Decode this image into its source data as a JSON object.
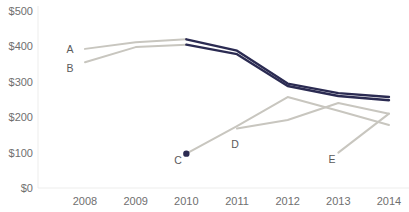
{
  "chart_data": {
    "type": "line",
    "title": "",
    "title_note": "title cropped off top edge of screenshot, illegible",
    "xlabel": "",
    "ylabel": "",
    "x": [
      2008,
      2009,
      2010,
      2011,
      2012,
      2013,
      2014
    ],
    "xtick_labels": [
      "2008",
      "2009",
      "2010",
      "2011",
      "2012",
      "2013",
      "2014"
    ],
    "ytick_labels": [
      "$0",
      "$100",
      "$200",
      "$300",
      "$400",
      "$500"
    ],
    "ytick_values": [
      0,
      100,
      200,
      300,
      400,
      500
    ],
    "ylim": [
      0,
      500
    ],
    "xlim": [
      2008,
      2014
    ],
    "grid": false,
    "legend": "inline-series-labels",
    "series": [
      {
        "name": "A",
        "label": "A",
        "color": "#2b2b52",
        "early_color": "#c8c6bf",
        "x": [
          2008,
          2009,
          2010,
          2011,
          2012,
          2013,
          2014
        ],
        "values": [
          393,
          412,
          420,
          388,
          295,
          268,
          257
        ]
      },
      {
        "name": "B",
        "label": "B",
        "color": "#2b2b52",
        "early_color": "#c8c6bf",
        "x": [
          2008,
          2009,
          2010,
          2011,
          2012,
          2013,
          2014
        ],
        "values": [
          355,
          398,
          405,
          378,
          288,
          260,
          248
        ]
      },
      {
        "name": "C",
        "label": "C",
        "color": "#c8c6bf",
        "marker_color": "#2b2b52",
        "x": [
          2010,
          2011,
          2012,
          2013,
          2014
        ],
        "values": [
          97,
          175,
          257,
          218,
          178
        ]
      },
      {
        "name": "D",
        "label": "D",
        "color": "#c8c6bf",
        "x": [
          2011,
          2012,
          2013,
          2014
        ],
        "values": [
          168,
          192,
          240,
          210
        ]
      },
      {
        "name": "E",
        "label": "E",
        "color": "#c8c6bf",
        "x": [
          2013,
          2014
        ],
        "values": [
          100,
          210
        ]
      }
    ],
    "series_label_points": [
      {
        "label": "A",
        "x": 70,
        "y": 53
      },
      {
        "label": "B",
        "x": 70,
        "y": 72
      },
      {
        "label": "C",
        "x": 178,
        "y": 164
      },
      {
        "label": "D",
        "x": 235,
        "y": 148
      },
      {
        "label": "E",
        "x": 332,
        "y": 163
      }
    ],
    "colors": {
      "navy": "#2b2b52",
      "gray": "#c8c6bf",
      "axis": "#ededec",
      "tick_text": "#6f6f6f",
      "series_label_text": "#5a5a5a",
      "background": "#ffffff"
    }
  }
}
